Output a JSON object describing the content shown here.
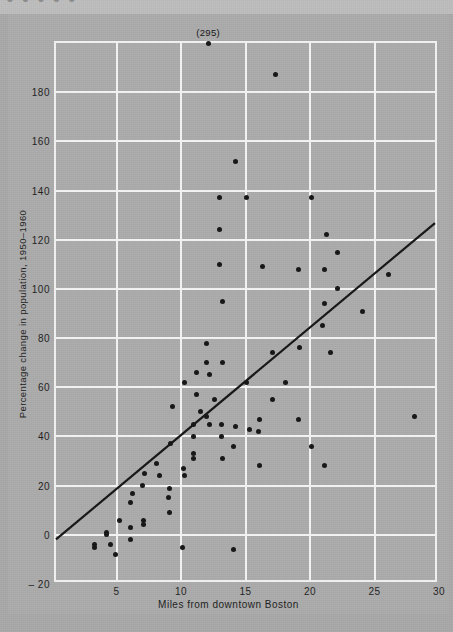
{
  "page": {
    "clipped_header_text": "● ● ● ● ●",
    "background_color": "#a8a8a8",
    "figure_background_color": "#ababab",
    "grid_color": "#f4f4f4",
    "point_color": "#141414",
    "line_color": "#141414"
  },
  "chart_data": {
    "type": "scatter",
    "title": "",
    "xlabel": "Miles from downtown Boston",
    "ylabel": "Percentage change in population, 1950–1960",
    "xlim": [
      0.3,
      30
    ],
    "ylim": [
      -20,
      200
    ],
    "xticks": [
      5,
      10,
      15,
      20,
      25,
      30
    ],
    "xticklabels": [
      "5",
      "10",
      "15",
      "20",
      "25",
      "30"
    ],
    "yticks": [
      -20,
      0,
      20,
      40,
      60,
      80,
      100,
      120,
      140,
      160,
      180
    ],
    "yticklabels": [
      "– 20",
      "0",
      "20",
      "40",
      "60",
      "80",
      "100",
      "120",
      "140",
      "160",
      "180"
    ],
    "grid": true,
    "legend": null,
    "annotations": [
      {
        "text": "(295)",
        "x": 12.1,
        "y": 200,
        "note": "off-scale point plotted at top frame; true value 295"
      }
    ],
    "trendline": {
      "type": "linear-fit",
      "x_start": 0.3,
      "y_start": -4,
      "x_end": 30.0,
      "y_end": 126
    },
    "points": [
      {
        "x": 12.1,
        "y": 200
      },
      {
        "x": 17.3,
        "y": 187
      },
      {
        "x": 14.2,
        "y": 152
      },
      {
        "x": 13.0,
        "y": 137
      },
      {
        "x": 15.1,
        "y": 137
      },
      {
        "x": 20.1,
        "y": 137
      },
      {
        "x": 13.0,
        "y": 124
      },
      {
        "x": 21.3,
        "y": 122
      },
      {
        "x": 22.1,
        "y": 115
      },
      {
        "x": 13.0,
        "y": 110
      },
      {
        "x": 16.3,
        "y": 109
      },
      {
        "x": 19.1,
        "y": 108
      },
      {
        "x": 21.1,
        "y": 108
      },
      {
        "x": 26.1,
        "y": 106
      },
      {
        "x": 22.1,
        "y": 100
      },
      {
        "x": 13.2,
        "y": 95
      },
      {
        "x": 21.1,
        "y": 94
      },
      {
        "x": 24.1,
        "y": 91
      },
      {
        "x": 21.0,
        "y": 85
      },
      {
        "x": 12.0,
        "y": 78
      },
      {
        "x": 19.2,
        "y": 76
      },
      {
        "x": 17.1,
        "y": 74
      },
      {
        "x": 21.6,
        "y": 74
      },
      {
        "x": 12.0,
        "y": 70
      },
      {
        "x": 13.2,
        "y": 70
      },
      {
        "x": 11.2,
        "y": 66
      },
      {
        "x": 12.2,
        "y": 65
      },
      {
        "x": 10.3,
        "y": 62
      },
      {
        "x": 15.1,
        "y": 62
      },
      {
        "x": 18.1,
        "y": 62
      },
      {
        "x": 11.2,
        "y": 57
      },
      {
        "x": 12.6,
        "y": 55
      },
      {
        "x": 17.1,
        "y": 55
      },
      {
        "x": 9.3,
        "y": 52
      },
      {
        "x": 11.5,
        "y": 50
      },
      {
        "x": 12.0,
        "y": 48
      },
      {
        "x": 16.1,
        "y": 47
      },
      {
        "x": 19.1,
        "y": 47
      },
      {
        "x": 11.0,
        "y": 45
      },
      {
        "x": 12.2,
        "y": 45
      },
      {
        "x": 13.1,
        "y": 45
      },
      {
        "x": 14.2,
        "y": 44
      },
      {
        "x": 15.3,
        "y": 43
      },
      {
        "x": 16.0,
        "y": 42
      },
      {
        "x": 11.0,
        "y": 40
      },
      {
        "x": 13.1,
        "y": 40
      },
      {
        "x": 9.2,
        "y": 37
      },
      {
        "x": 14.1,
        "y": 36
      },
      {
        "x": 20.1,
        "y": 36
      },
      {
        "x": 11.0,
        "y": 33
      },
      {
        "x": 11.0,
        "y": 31
      },
      {
        "x": 13.2,
        "y": 31
      },
      {
        "x": 8.1,
        "y": 29
      },
      {
        "x": 10.2,
        "y": 27
      },
      {
        "x": 16.1,
        "y": 28
      },
      {
        "x": 21.1,
        "y": 28
      },
      {
        "x": 7.2,
        "y": 25
      },
      {
        "x": 8.3,
        "y": 24
      },
      {
        "x": 10.3,
        "y": 24
      },
      {
        "x": 7.0,
        "y": 20
      },
      {
        "x": 9.1,
        "y": 19
      },
      {
        "x": 6.2,
        "y": 17
      },
      {
        "x": 9.0,
        "y": 15
      },
      {
        "x": 6.1,
        "y": 13
      },
      {
        "x": 9.1,
        "y": 9
      },
      {
        "x": 5.2,
        "y": 6
      },
      {
        "x": 7.1,
        "y": 6
      },
      {
        "x": 7.1,
        "y": 4
      },
      {
        "x": 6.1,
        "y": 3
      },
      {
        "x": 4.2,
        "y": 1
      },
      {
        "x": 4.2,
        "y": 0
      },
      {
        "x": 6.1,
        "y": -2
      },
      {
        "x": 28.1,
        "y": 48
      },
      {
        "x": 10.1,
        "y": -5
      },
      {
        "x": 14.1,
        "y": -6
      },
      {
        "x": 3.3,
        "y": -4
      },
      {
        "x": 3.3,
        "y": -5
      },
      {
        "x": 4.5,
        "y": -4
      },
      {
        "x": 4.9,
        "y": -8
      }
    ]
  }
}
